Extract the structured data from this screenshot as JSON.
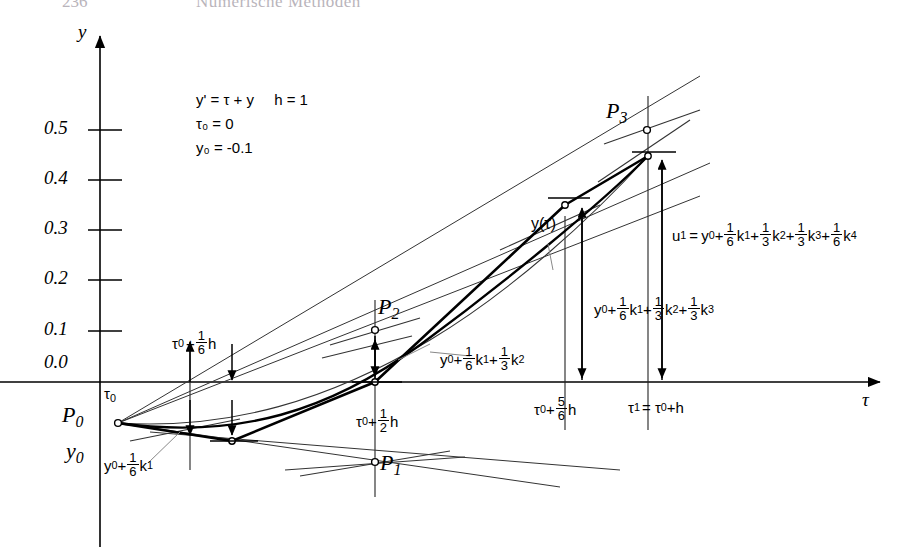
{
  "header": {
    "page_number": "236",
    "title": "Numerische Methoden"
  },
  "axes": {
    "y_label": "y",
    "x_label": "τ",
    "y_ticks": [
      "0.5",
      "0.4",
      "0.3",
      "0.2",
      "0.1",
      "0.0"
    ]
  },
  "equations": {
    "ode": "y' = τ + y",
    "step": "h = 1",
    "tau0": "τ₀ = 0",
    "y0": "y₀ = -0.1"
  },
  "points": {
    "p0": "P",
    "p0_sub": "0",
    "p1": "P",
    "p1_sub": "1",
    "p2": "P",
    "p2_sub": "2",
    "p3": "P",
    "p3_sub": "3"
  },
  "origin_labels": {
    "tau0": "τ",
    "tau0_sub": "0",
    "y0": "y",
    "y0_sub": "0"
  },
  "x_marks": {
    "m1_pre": "τ",
    "m1_sub": "0",
    "m1_plus": "+",
    "m1_num": "1",
    "m1_den": "6",
    "m1_post": "h",
    "m2_pre": "τ",
    "m2_sub": "0",
    "m2_plus": "+",
    "m2_num": "1",
    "m2_den": "2",
    "m2_post": "h",
    "m3_pre": "τ",
    "m3_sub": "0",
    "m3_plus": "+",
    "m3_num": "5",
    "m3_den": "6",
    "m3_post": "h",
    "m4": "τ",
    "m4_sub": "1",
    "m4_eq": "= τ",
    "m4_sub2": "0",
    "m4_tail": "+h"
  },
  "curve_label": "y(τ)",
  "value_labels": {
    "v1": {
      "y0": "y",
      "y0_sub": "0",
      "plus1": "+",
      "n1": "1",
      "d1": "6",
      "k1": "k",
      "k1_sub": "1"
    },
    "v2": {
      "y0": "y",
      "y0_sub": "0",
      "plus1": "+",
      "n1": "1",
      "d1": "6",
      "k1": "k",
      "k1_sub": "1",
      "plus2": "+",
      "n2": "1",
      "d2": "3",
      "k2": "k",
      "k2_sub": "2"
    },
    "v3": {
      "y0": "y",
      "y0_sub": "0",
      "plus1": "+",
      "n1": "1",
      "d1": "6",
      "k1": "k",
      "k1_sub": "1",
      "plus2": "+",
      "n2": "1",
      "d2": "3",
      "k2": "k",
      "k2_sub": "2",
      "plus3": "+",
      "n3": "1",
      "d3": "3",
      "k3": "k",
      "k3_sub": "3"
    },
    "v4": {
      "u1": "u",
      "u1_sub": "1",
      "eq": "=",
      "y0": "y",
      "y0_sub": "0",
      "plus1": "+",
      "n1": "1",
      "d1": "6",
      "k1": "k",
      "k1_sub": "1",
      "plus2": "+",
      "n2": "1",
      "d2": "3",
      "k2": "k",
      "k2_sub": "2",
      "plus3": "+",
      "n3": "1",
      "d3": "3",
      "k3": "k",
      "k3_sub": "3",
      "plus4": "+",
      "n4": "1",
      "d4": "6",
      "k4": "k",
      "k4_sub": "4"
    }
  },
  "colors": {
    "ink": "#000000",
    "header": "#b9b4bb",
    "thin": "#333333"
  }
}
